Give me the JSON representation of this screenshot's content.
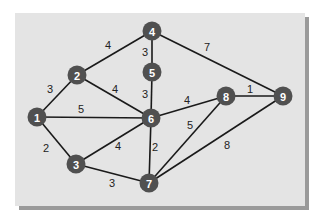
{
  "graph": {
    "title": "",
    "nodes": [
      {
        "id": "1",
        "label": "1",
        "x": 37,
        "y": 117
      },
      {
        "id": "2",
        "label": "2",
        "x": 77,
        "y": 75
      },
      {
        "id": "3",
        "label": "3",
        "x": 76,
        "y": 164
      },
      {
        "id": "4",
        "label": "4",
        "x": 152,
        "y": 31
      },
      {
        "id": "5",
        "label": "5",
        "x": 152,
        "y": 72
      },
      {
        "id": "6",
        "label": "6",
        "x": 151,
        "y": 118
      },
      {
        "id": "7",
        "label": "7",
        "x": 149,
        "y": 183
      },
      {
        "id": "8",
        "label": "8",
        "x": 226,
        "y": 96
      },
      {
        "id": "9",
        "label": "9",
        "x": 283,
        "y": 96
      }
    ],
    "edges": [
      {
        "from": "1",
        "to": "2",
        "weight": "3",
        "lx": 50,
        "ly": 89
      },
      {
        "from": "1",
        "to": "6",
        "weight": "5",
        "lx": 81,
        "ly": 109
      },
      {
        "from": "1",
        "to": "3",
        "weight": "2",
        "lx": 46,
        "ly": 148
      },
      {
        "from": "2",
        "to": "4",
        "weight": "4",
        "lx": 108,
        "ly": 45
      },
      {
        "from": "2",
        "to": "6",
        "weight": "4",
        "lx": 115,
        "ly": 89
      },
      {
        "from": "4",
        "to": "5",
        "weight": "3",
        "lx": 145,
        "ly": 52
      },
      {
        "from": "4",
        "to": "9",
        "weight": "7",
        "lx": 207,
        "ly": 47
      },
      {
        "from": "5",
        "to": "6",
        "weight": "3",
        "lx": 145,
        "ly": 94
      },
      {
        "from": "6",
        "to": "8",
        "weight": "4",
        "lx": 187,
        "ly": 100
      },
      {
        "from": "8",
        "to": "9",
        "weight": "1",
        "lx": 250,
        "ly": 89
      },
      {
        "from": "6",
        "to": "3",
        "weight": "4",
        "lx": 118,
        "ly": 146
      },
      {
        "from": "6",
        "to": "7",
        "weight": "2",
        "lx": 155,
        "ly": 147
      },
      {
        "from": "8",
        "to": "7",
        "weight": "5",
        "lx": 190,
        "ly": 125
      },
      {
        "from": "9",
        "to": "7",
        "weight": "8",
        "lx": 227,
        "ly": 145
      },
      {
        "from": "3",
        "to": "7",
        "weight": "3",
        "lx": 112,
        "ly": 183
      }
    ]
  },
  "colors": {
    "panel": "#e4e4e4",
    "panel_shadow": "#9a9a9a",
    "node_fill": "#505050",
    "node_text": "#ffffff",
    "edge": "#1a1a1a"
  }
}
